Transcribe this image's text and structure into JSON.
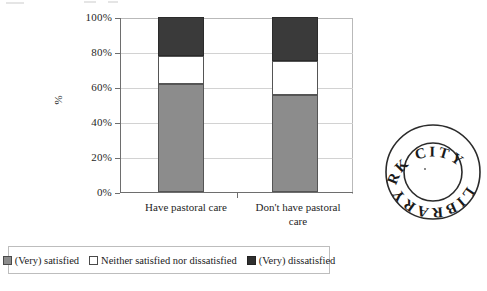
{
  "chart_data": {
    "type": "bar",
    "subtype": "stacked-100-percent",
    "title": "",
    "xlabel": "",
    "ylabel": "%",
    "ylim": [
      0,
      100
    ],
    "ytick_labels": [
      "100%",
      "80%",
      "60%",
      "40%",
      "20%",
      "0%"
    ],
    "ytick_values": [
      100,
      80,
      60,
      40,
      20,
      0
    ],
    "grid": true,
    "legend_position": "bottom",
    "categories": [
      "Have pastoral care",
      "Don't have pastoral care"
    ],
    "series": [
      {
        "name": "(Very) satisfied",
        "color": "#8c8c8c",
        "values": [
          62,
          55.5
        ]
      },
      {
        "name": "Neither satisfied nor dissatisfied",
        "color": "#ffffff",
        "values": [
          16,
          19.5
        ]
      },
      {
        "name": "(Very) dissatisfied",
        "color": "#3a3a3a",
        "values": [
          22,
          25
        ]
      }
    ]
  },
  "axis": {
    "y_title": "%",
    "y_ticks": [
      {
        "label": "100%",
        "value": 100
      },
      {
        "label": "80%",
        "value": 80
      },
      {
        "label": "60%",
        "value": 60
      },
      {
        "label": "40%",
        "value": 40
      },
      {
        "label": "20%",
        "value": 20
      },
      {
        "label": "0%",
        "value": 0
      }
    ],
    "x_categories": [
      {
        "line1": "Have pastoral care",
        "line2": ""
      },
      {
        "line1": "Don't have pastoral",
        "line2": "care"
      }
    ]
  },
  "legend": {
    "items": [
      {
        "label": "(Very) satisfied",
        "swatch": "sat"
      },
      {
        "label": "Neither satisfied nor dissatisfied",
        "swatch": "neu"
      },
      {
        "label": "(Very) dissatisfied",
        "swatch": "dis"
      }
    ]
  },
  "stamp": {
    "top_text": "CORK",
    "right_text": "CITY",
    "bottom_text": "LIBRARY",
    "full_text": "CORK CITY LIBRARY"
  },
  "colors": {
    "satisfied": "#8c8c8c",
    "neutral": "#ffffff",
    "dissatisfied": "#3a3a3a",
    "axis": "#6e6e6e",
    "grid": "#d2d2d2"
  }
}
